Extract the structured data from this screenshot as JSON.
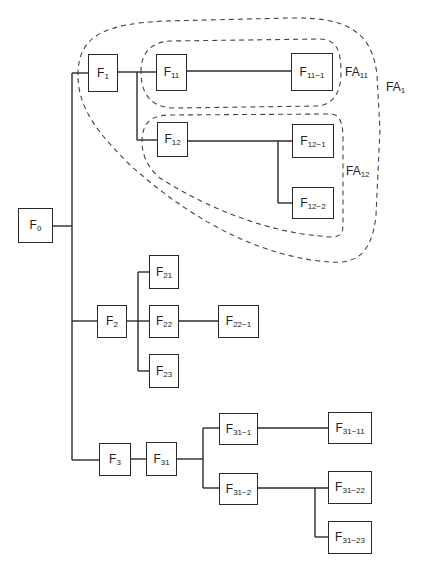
{
  "diagram": {
    "type": "function-tree",
    "line_color": "#2a2a2a",
    "dash_color": "#444444",
    "nodes": [
      {
        "id": "F0",
        "base": "F",
        "sub": "0",
        "x": 18,
        "y": 208,
        "w": 35,
        "h": 35
      },
      {
        "id": "F1",
        "base": "F",
        "sub": "1",
        "x": 88,
        "y": 54,
        "w": 30,
        "h": 38
      },
      {
        "id": "F11",
        "base": "F",
        "sub": "11",
        "x": 156,
        "y": 54,
        "w": 31,
        "h": 37
      },
      {
        "id": "F11-1",
        "base": "F",
        "sub": "11−1",
        "x": 291,
        "y": 53,
        "w": 42,
        "h": 38
      },
      {
        "id": "F12",
        "base": "F",
        "sub": "12",
        "x": 157,
        "y": 122,
        "w": 31,
        "h": 35
      },
      {
        "id": "F12-1",
        "base": "F",
        "sub": "12−1",
        "x": 292,
        "y": 124,
        "w": 42,
        "h": 34
      },
      {
        "id": "F12-2",
        "base": "F",
        "sub": "12−2",
        "x": 292,
        "y": 187,
        "w": 42,
        "h": 32
      },
      {
        "id": "F2",
        "base": "F",
        "sub": "2",
        "x": 97,
        "y": 305,
        "w": 30,
        "h": 33
      },
      {
        "id": "F21",
        "base": "F",
        "sub": "21",
        "x": 149,
        "y": 255,
        "w": 30,
        "h": 34
      },
      {
        "id": "F22",
        "base": "F",
        "sub": "22",
        "x": 149,
        "y": 305,
        "w": 30,
        "h": 33
      },
      {
        "id": "F22-1",
        "base": "F",
        "sub": "22−1",
        "x": 218,
        "y": 305,
        "w": 41,
        "h": 33
      },
      {
        "id": "F23",
        "base": "F",
        "sub": "23",
        "x": 149,
        "y": 354,
        "w": 30,
        "h": 34
      },
      {
        "id": "F3",
        "base": "F",
        "sub": "3",
        "x": 99,
        "y": 443,
        "w": 32,
        "h": 33
      },
      {
        "id": "F31",
        "base": "F",
        "sub": "31",
        "x": 146,
        "y": 442,
        "w": 31,
        "h": 34
      },
      {
        "id": "F31-1",
        "base": "F",
        "sub": "31−1",
        "x": 219,
        "y": 413,
        "w": 39,
        "h": 32
      },
      {
        "id": "F31-2",
        "base": "F",
        "sub": "31−2",
        "x": 219,
        "y": 473,
        "w": 39,
        "h": 32
      },
      {
        "id": "F31-11",
        "base": "F",
        "sub": "31−11",
        "x": 328,
        "y": 412,
        "w": 44,
        "h": 32
      },
      {
        "id": "F31-22",
        "base": "F",
        "sub": "31−22",
        "x": 328,
        "y": 471,
        "w": 44,
        "h": 33
      },
      {
        "id": "F31-23",
        "base": "F",
        "sub": "31−23",
        "x": 328,
        "y": 521,
        "w": 44,
        "h": 33
      }
    ],
    "areas": [
      {
        "id": "FA1",
        "base": "FA",
        "sub": "1",
        "label_x": 386,
        "label_y": 80
      },
      {
        "id": "FA11",
        "base": "FA",
        "sub": "11",
        "label_x": 345,
        "label_y": 65
      },
      {
        "id": "FA12",
        "base": "FA",
        "sub": "12",
        "label_x": 346,
        "label_y": 164
      }
    ]
  }
}
